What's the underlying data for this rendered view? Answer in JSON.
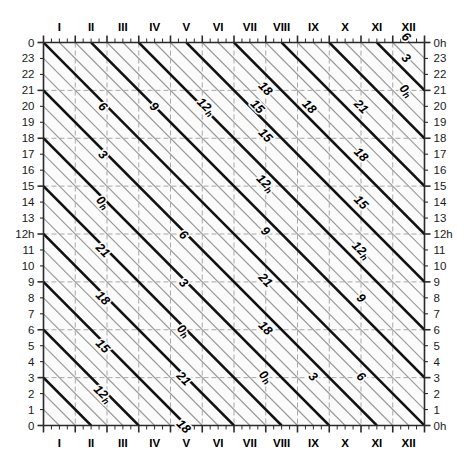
{
  "chart_data": {
    "type": "line",
    "title": "",
    "xlabel": "",
    "ylabel": "",
    "x_axis": {
      "name": "month",
      "position_top": "I..XII",
      "position_bottom": "I..XII",
      "categories": [
        "I",
        "II",
        "III",
        "IV",
        "V",
        "VI",
        "VII",
        "VIII",
        "IX",
        "X",
        "XI",
        "XII"
      ],
      "minor_ticks_per_month": 3,
      "range_days": [
        0,
        12
      ]
    },
    "y_axis": {
      "name": "hour",
      "direction": "descending-then-repeating",
      "left_ticks": [
        "0",
        "23",
        "22",
        "21",
        "20",
        "19",
        "18",
        "17",
        "16",
        "15",
        "14",
        "13",
        "12h",
        "11",
        "10",
        "9",
        "8",
        "7",
        "6",
        "5",
        "4",
        "3",
        "2",
        "1",
        "0"
      ],
      "right_ticks": [
        "0h",
        "23",
        "22",
        "21",
        "20",
        "19",
        "18",
        "17",
        "16",
        "15",
        "14",
        "13",
        "12h",
        "11",
        "10",
        "9",
        "8",
        "7",
        "6",
        "5",
        "4",
        "3",
        "2",
        "1",
        "0h"
      ],
      "total_steps": 24,
      "grid_every": 3
    },
    "contours": {
      "major_interval_hours": 3,
      "minor_interval_hours": 1,
      "major_labels": [
        "0h",
        "3",
        "6",
        "9",
        "12h",
        "15",
        "18",
        "21"
      ],
      "slope_hours_per_year": 24,
      "major_color": "#111111",
      "minor_color": "#9a9a9a",
      "grid_color": "#a8a8a8"
    },
    "labels": [
      {
        "text": "6",
        "sub": "",
        "xf": 0.148,
        "yf": 0.175
      },
      {
        "text": "9",
        "sub": "",
        "xf": 0.283,
        "yf": 0.175
      },
      {
        "text": "12",
        "sub": "h",
        "xf": 0.419,
        "yf": 0.175
      },
      {
        "text": "15",
        "sub": "",
        "xf": 0.554,
        "yf": 0.175
      },
      {
        "text": "18",
        "sub": "",
        "xf": 0.69,
        "yf": 0.175
      },
      {
        "text": "21",
        "sub": "",
        "xf": 0.826,
        "yf": 0.175
      },
      {
        "text": "0",
        "sub": "h",
        "xf": 0.944,
        "yf": 0.133
      },
      {
        "text": "3",
        "sub": "",
        "xf": 0.944,
        "yf": 0.048
      },
      {
        "text": "6",
        "sub": "",
        "xf": 0.944,
        "yf": -0.007
      },
      {
        "text": "3",
        "sub": "",
        "xf": 0.148,
        "yf": 0.3
      },
      {
        "text": "0",
        "sub": "h",
        "xf": 0.148,
        "yf": 0.425
      },
      {
        "text": "21",
        "sub": "",
        "xf": 0.148,
        "yf": 0.55
      },
      {
        "text": "18",
        "sub": "",
        "xf": 0.148,
        "yf": 0.675
      },
      {
        "text": "15",
        "sub": "",
        "xf": 0.148,
        "yf": 0.8
      },
      {
        "text": "12",
        "sub": "h",
        "xf": 0.148,
        "yf": 0.925
      },
      {
        "text": "9",
        "sub": "",
        "xf": 0.148,
        "yf": 1.05
      },
      {
        "text": "6",
        "sub": "",
        "xf": 0.36,
        "yf": 0.51
      },
      {
        "text": "3",
        "sub": "",
        "xf": 0.36,
        "yf": 0.635
      },
      {
        "text": "0",
        "sub": "h",
        "xf": 0.36,
        "yf": 0.76
      },
      {
        "text": "21",
        "sub": "",
        "xf": 0.36,
        "yf": 0.885
      },
      {
        "text": "18",
        "sub": "",
        "xf": 0.36,
        "yf": 1.01
      },
      {
        "text": "9",
        "sub": "",
        "xf": 0.575,
        "yf": 0.5
      },
      {
        "text": "12",
        "sub": "h",
        "xf": 0.575,
        "yf": 0.375
      },
      {
        "text": "15",
        "sub": "",
        "xf": 0.575,
        "yf": 0.25
      },
      {
        "text": "18",
        "sub": "",
        "xf": 0.575,
        "yf": 0.128
      },
      {
        "text": "21",
        "sub": "",
        "xf": 0.575,
        "yf": 0.628
      },
      {
        "text": "18",
        "sub": "",
        "xf": 0.575,
        "yf": 0.753
      },
      {
        "text": "0",
        "sub": "h",
        "xf": 0.575,
        "yf": 0.88
      },
      {
        "text": "3",
        "sub": "",
        "xf": 0.7,
        "yf": 0.88
      },
      {
        "text": "6",
        "sub": "",
        "xf": 0.826,
        "yf": 0.88
      },
      {
        "text": "18",
        "sub": "",
        "xf": 0.826,
        "yf": 0.3
      },
      {
        "text": "15",
        "sub": "",
        "xf": 0.826,
        "yf": 0.425
      },
      {
        "text": "12",
        "sub": "h",
        "xf": 0.826,
        "yf": 0.55
      },
      {
        "text": "9",
        "sub": "",
        "xf": 0.826,
        "yf": 0.675
      }
    ]
  },
  "axes": {
    "months": [
      "I",
      "II",
      "III",
      "IV",
      "V",
      "VI",
      "VII",
      "VIII",
      "IX",
      "X",
      "XI",
      "XII"
    ],
    "left_labels": [
      "0",
      "23",
      "22",
      "21",
      "20",
      "19",
      "18",
      "17",
      "16",
      "15",
      "14",
      "13",
      "12h",
      "11",
      "10",
      "9",
      "8",
      "7",
      "6",
      "5",
      "4",
      "3",
      "2",
      "1",
      "0"
    ],
    "right_labels": [
      "0h",
      "23",
      "22",
      "21",
      "20",
      "19",
      "18",
      "17",
      "16",
      "15",
      "14",
      "13",
      "12h",
      "11",
      "10",
      "9",
      "8",
      "7",
      "6",
      "5",
      "4",
      "3",
      "2",
      "1",
      "0h"
    ]
  },
  "colors": {
    "background": "#ffffff",
    "plot_fill": "#fbfbfb",
    "major_line": "#111111",
    "minor_line": "#9a9a9a",
    "grid_line": "#a8a8a8",
    "frame": "#2a2a2a",
    "text": "#1a1a1a"
  }
}
